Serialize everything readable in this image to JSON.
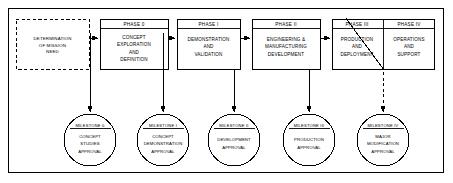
{
  "diagram": {
    "type": "process-flow",
    "colors": {
      "stroke": "#000000",
      "fill": "#ffffff"
    },
    "start_node": {
      "label": "DETERMINATION OF MISSION NEED",
      "lines": [
        "DETERMINATION",
        "OF MISSION",
        "NEED"
      ],
      "style": "dashed"
    },
    "phases": [
      {
        "id": "phase-0",
        "title": "PHASE 0",
        "lines": [
          "CONCEPT",
          "EXPLORATION",
          "AND",
          "DEFINITION"
        ]
      },
      {
        "id": "phase-1",
        "title": "PHASE I",
        "lines": [
          "DEMONSTRATION",
          "AND",
          "VALIDATION"
        ]
      },
      {
        "id": "phase-2",
        "title": "PHASE II",
        "lines": [
          "ENGINEERING &",
          "MANUFACTURING",
          "DEVELOPMENT"
        ]
      },
      {
        "id": "phase-3",
        "title": "PHASE III",
        "lines": [
          "PRODUCTION",
          "AND",
          "DEPLOYMENT"
        ]
      },
      {
        "id": "phase-4",
        "title": "PHASE IV",
        "lines": [
          "OPERATIONS",
          "AND",
          "SUPPORT"
        ]
      }
    ],
    "milestones": [
      {
        "id": "milestone-0",
        "title": "MILESTONE 0",
        "lines": [
          "CONCEPT",
          "STUDIES",
          "APPROVAL"
        ]
      },
      {
        "id": "milestone-1",
        "title": "MILESTONE I",
        "lines": [
          "CONCEPT",
          "DEMONSTRATION",
          "APPROVAL"
        ]
      },
      {
        "id": "milestone-2",
        "title": "MILESTONE II",
        "lines": [
          "DEVELOPMENT",
          "APPROVAL"
        ]
      },
      {
        "id": "milestone-3",
        "title": "MILESTONE III",
        "lines": [
          "PRODUCTION",
          "APPROVAL"
        ]
      },
      {
        "id": "milestone-4",
        "title": "MILESTONE IV",
        "lines": [
          "MAJOR",
          "MODIFICATION",
          "APPROVAL"
        ]
      }
    ],
    "connectors": [
      {
        "from": "start-node",
        "to": "phase-0",
        "style": "solid-arrow"
      },
      {
        "from": "phase-0",
        "to": "phase-1",
        "style": "solid-arrow"
      },
      {
        "from": "phase-1",
        "to": "phase-2",
        "style": "solid-arrow"
      },
      {
        "from": "phase-2",
        "to": "phase-3",
        "style": "solid-arrow"
      },
      {
        "from": "link-0",
        "to": "milestone-0",
        "style": "solid-arrow-down"
      },
      {
        "from": "link-1",
        "to": "milestone-1",
        "style": "solid-arrow-down"
      },
      {
        "from": "link-2",
        "to": "milestone-2",
        "style": "solid-arrow-down"
      },
      {
        "from": "link-3",
        "to": "milestone-3",
        "style": "solid-arrow-down"
      },
      {
        "from": "phase-4",
        "to": "milestone-4",
        "style": "dashed-arrow-down"
      }
    ]
  }
}
